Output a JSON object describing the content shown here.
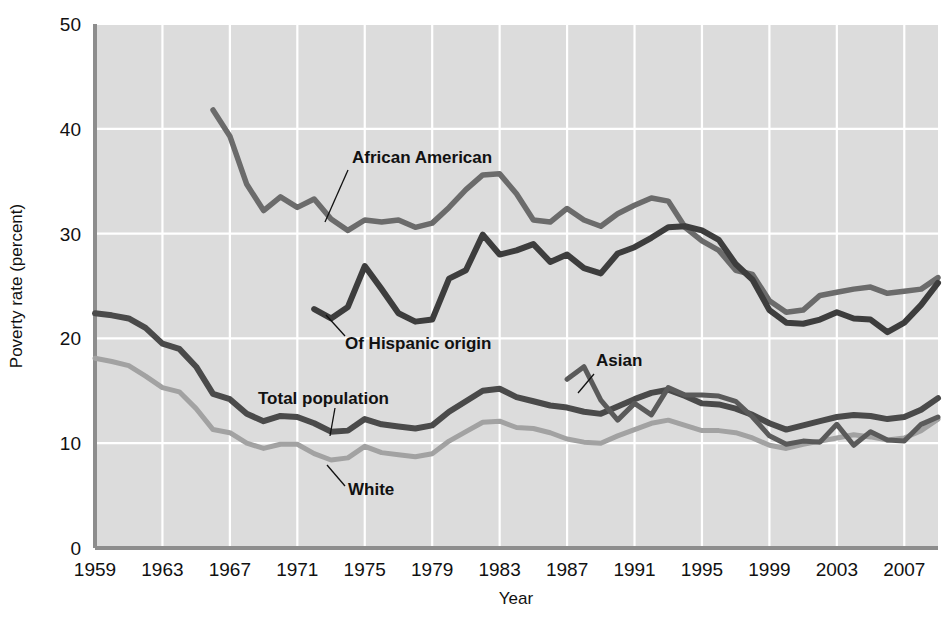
{
  "chart_data": {
    "type": "line",
    "title": "",
    "xlabel": "Year",
    "ylabel": "Poverty rate (percent)",
    "xlim": [
      1959,
      2009
    ],
    "ylim": [
      0,
      50
    ],
    "grid": true,
    "legend_position": "inline-annotations",
    "y_ticks": [
      "0",
      "10",
      "20",
      "30",
      "40",
      "50"
    ],
    "y_tick_values": [
      0,
      10,
      20,
      30,
      40,
      50
    ],
    "x_ticks": [
      "1959",
      "1963",
      "1967",
      "1971",
      "1975",
      "1979",
      "1983",
      "1987",
      "1991",
      "1995",
      "1999",
      "2003",
      "2007"
    ],
    "x_tick_values": [
      1959,
      1963,
      1967,
      1971,
      1975,
      1979,
      1983,
      1987,
      1991,
      1995,
      1999,
      2003,
      2007
    ],
    "colors": {
      "plot_background": "#dcdcdc",
      "gridline": "#ffffff",
      "axis": "#8d8d8d",
      "african_american": "#6b6b6b",
      "hispanic": "#3d3d3d",
      "total_population": "#4a4a4a",
      "white": "#a2a2a2",
      "asian": "#5a5a5a",
      "text": "#111111"
    },
    "series": [
      {
        "name": "African American",
        "label": "African American",
        "color": "#6b6b6b",
        "x": [
          1966,
          1967,
          1968,
          1969,
          1970,
          1971,
          1972,
          1973,
          1974,
          1975,
          1976,
          1977,
          1978,
          1979,
          1980,
          1981,
          1982,
          1983,
          1984,
          1985,
          1986,
          1987,
          1988,
          1989,
          1990,
          1991,
          1992,
          1993,
          1994,
          1995,
          1996,
          1997,
          1998,
          1999,
          2000,
          2001,
          2002,
          2003,
          2004,
          2005,
          2006,
          2007,
          2008,
          2009
        ],
        "values": [
          41.8,
          39.3,
          34.7,
          32.2,
          33.5,
          32.5,
          33.3,
          31.4,
          30.3,
          31.3,
          31.1,
          31.3,
          30.6,
          31.0,
          32.5,
          34.2,
          35.6,
          35.7,
          33.8,
          31.3,
          31.1,
          32.4,
          31.3,
          30.7,
          31.9,
          32.7,
          33.4,
          33.1,
          30.6,
          29.3,
          28.4,
          26.5,
          26.1,
          23.6,
          22.5,
          22.7,
          24.1,
          24.4,
          24.7,
          24.9,
          24.3,
          24.5,
          24.7,
          25.8
        ]
      },
      {
        "name": "Of Hispanic origin",
        "label": "Of Hispanic origin",
        "color": "#3d3d3d",
        "x": [
          1972,
          1973,
          1974,
          1975,
          1976,
          1977,
          1978,
          1979,
          1980,
          1981,
          1982,
          1983,
          1984,
          1985,
          1986,
          1987,
          1988,
          1989,
          1990,
          1991,
          1992,
          1993,
          1994,
          1995,
          1996,
          1997,
          1998,
          1999,
          2000,
          2001,
          2002,
          2003,
          2004,
          2005,
          2006,
          2007,
          2008,
          2009
        ],
        "values": [
          22.8,
          21.9,
          23.0,
          26.9,
          24.7,
          22.4,
          21.6,
          21.8,
          25.7,
          26.5,
          29.9,
          28.0,
          28.4,
          29.0,
          27.3,
          28.0,
          26.7,
          26.2,
          28.1,
          28.7,
          29.6,
          30.6,
          30.7,
          30.3,
          29.4,
          27.1,
          25.6,
          22.7,
          21.5,
          21.4,
          21.8,
          22.5,
          21.9,
          21.8,
          20.6,
          21.5,
          23.2,
          25.3
        ]
      },
      {
        "name": "Total population",
        "label": "Total population",
        "color": "#4a4a4a",
        "x": [
          1959,
          1960,
          1961,
          1962,
          1963,
          1964,
          1965,
          1966,
          1967,
          1968,
          1969,
          1970,
          1971,
          1972,
          1973,
          1974,
          1975,
          1976,
          1977,
          1978,
          1979,
          1980,
          1981,
          1982,
          1983,
          1984,
          1985,
          1986,
          1987,
          1988,
          1989,
          1990,
          1991,
          1992,
          1993,
          1994,
          1995,
          1996,
          1997,
          1998,
          1999,
          2000,
          2001,
          2002,
          2003,
          2004,
          2005,
          2006,
          2007,
          2008,
          2009
        ],
        "values": [
          22.4,
          22.2,
          21.9,
          21.0,
          19.5,
          19.0,
          17.3,
          14.7,
          14.2,
          12.8,
          12.1,
          12.6,
          12.5,
          11.9,
          11.1,
          11.2,
          12.3,
          11.8,
          11.6,
          11.4,
          11.7,
          13.0,
          14.0,
          15.0,
          15.2,
          14.4,
          14.0,
          13.6,
          13.4,
          13.0,
          12.8,
          13.5,
          14.2,
          14.8,
          15.1,
          14.5,
          13.8,
          13.7,
          13.3,
          12.7,
          11.9,
          11.3,
          11.7,
          12.1,
          12.5,
          12.7,
          12.6,
          12.3,
          12.5,
          13.2,
          14.3
        ]
      },
      {
        "name": "White",
        "label": "White",
        "color": "#a2a2a2",
        "x": [
          1959,
          1960,
          1961,
          1962,
          1963,
          1964,
          1965,
          1966,
          1967,
          1968,
          1969,
          1970,
          1971,
          1972,
          1973,
          1974,
          1975,
          1976,
          1977,
          1978,
          1979,
          1980,
          1981,
          1982,
          1983,
          1984,
          1985,
          1986,
          1987,
          1988,
          1989,
          1990,
          1991,
          1992,
          1993,
          1994,
          1995,
          1996,
          1997,
          1998,
          1999,
          2000,
          2001,
          2002,
          2003,
          2004,
          2005,
          2006,
          2007,
          2008,
          2009
        ],
        "values": [
          18.1,
          17.8,
          17.4,
          16.4,
          15.3,
          14.9,
          13.3,
          11.3,
          11.0,
          10.0,
          9.5,
          9.9,
          9.9,
          9.0,
          8.4,
          8.6,
          9.7,
          9.1,
          8.9,
          8.7,
          9.0,
          10.2,
          11.1,
          12.0,
          12.1,
          11.5,
          11.4,
          11.0,
          10.4,
          10.1,
          10.0,
          10.7,
          11.3,
          11.9,
          12.2,
          11.7,
          11.2,
          11.2,
          11.0,
          10.5,
          9.8,
          9.5,
          9.9,
          10.2,
          10.5,
          10.8,
          10.6,
          10.3,
          10.5,
          11.2,
          12.3
        ]
      },
      {
        "name": "Asian",
        "label": "Asian",
        "color": "#5a5a5a",
        "x": [
          1987,
          1988,
          1989,
          1990,
          1991,
          1992,
          1993,
          1994,
          1995,
          1996,
          1997,
          1998,
          1999,
          2000,
          2001,
          2002,
          2003,
          2004,
          2005,
          2006,
          2007,
          2008,
          2009
        ],
        "values": [
          16.1,
          17.3,
          14.1,
          12.2,
          13.8,
          12.7,
          15.3,
          14.6,
          14.6,
          14.5,
          14.0,
          12.5,
          10.7,
          9.9,
          10.2,
          10.1,
          11.8,
          9.8,
          11.1,
          10.3,
          10.2,
          11.8,
          12.5
        ]
      }
    ],
    "annotations": [
      {
        "label": "African American",
        "x_px": 352,
        "y_px": 163
      },
      {
        "label": "Of Hispanic origin",
        "x_px": 345,
        "y_px": 343
      },
      {
        "label": "Total population",
        "x_px": 258,
        "y_px": 400
      },
      {
        "label": "White",
        "x_px": 348,
        "y_px": 491
      },
      {
        "label": "Asian",
        "x_px": 596,
        "y_px": 366
      }
    ]
  }
}
